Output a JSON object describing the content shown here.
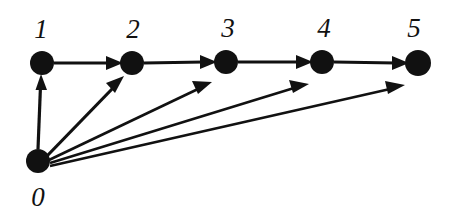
{
  "diagram": {
    "type": "directed-graph",
    "background_color": "#ffffff",
    "node_color": "#111111",
    "edge_color": "#111111",
    "label_color": "#111111",
    "nodes": [
      {
        "id": "0",
        "label": "0",
        "cx": 38,
        "cy": 161,
        "r": 12,
        "label_x": 38,
        "label_y": 206
      },
      {
        "id": "1",
        "label": "1",
        "cx": 42,
        "cy": 63,
        "r": 12,
        "label_x": 41,
        "label_y": 38
      },
      {
        "id": "2",
        "label": "2",
        "cx": 132,
        "cy": 63,
        "r": 12,
        "label_x": 133,
        "label_y": 38
      },
      {
        "id": "3",
        "label": "3",
        "cx": 226,
        "cy": 62,
        "r": 12,
        "label_x": 228,
        "label_y": 37
      },
      {
        "id": "4",
        "label": "4",
        "cx": 322,
        "cy": 62,
        "r": 12,
        "label_x": 324,
        "label_y": 37
      },
      {
        "id": "5",
        "label": "5",
        "cx": 418,
        "cy": 63,
        "r": 13,
        "label_x": 414,
        "label_y": 37
      }
    ],
    "edges": [
      {
        "id": "e-0-1",
        "from": "0",
        "to": "1",
        "directed": true
      },
      {
        "id": "e-0-2",
        "from": "0",
        "to": "2",
        "directed": true
      },
      {
        "id": "e-0-3",
        "from": "0",
        "to": "3",
        "directed": true
      },
      {
        "id": "e-0-4",
        "from": "0",
        "to": "4",
        "directed": true
      },
      {
        "id": "e-0-5",
        "from": "0",
        "to": "5",
        "directed": true
      },
      {
        "id": "e-1-2",
        "from": "1",
        "to": "2",
        "directed": true
      },
      {
        "id": "e-2-3",
        "from": "2",
        "to": "3",
        "directed": true
      },
      {
        "id": "e-3-4",
        "from": "3",
        "to": "4",
        "directed": true
      },
      {
        "id": "e-4-5",
        "from": "4",
        "to": "5",
        "directed": true
      }
    ]
  }
}
